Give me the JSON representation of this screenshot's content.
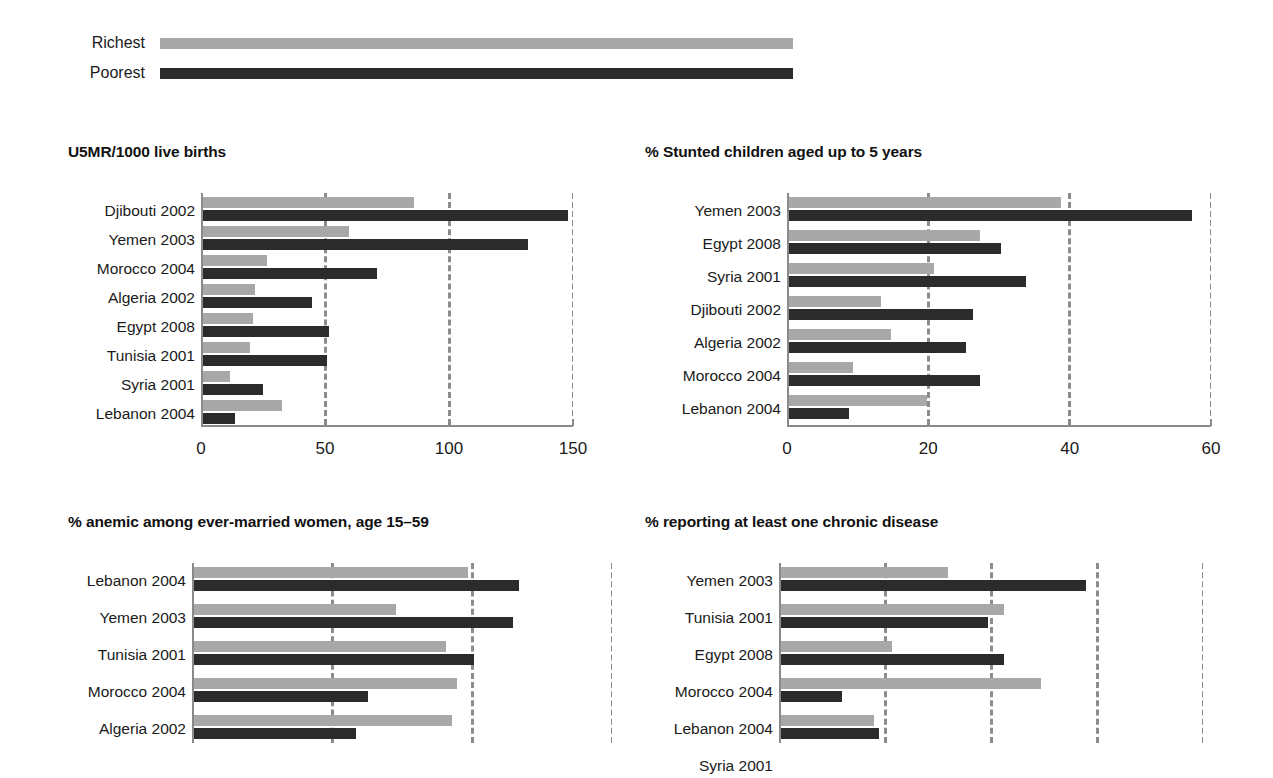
{
  "legend": {
    "items": [
      {
        "label": "Richest",
        "color": "#a8a8a8",
        "bar_width_px": 633
      },
      {
        "label": "Poorest",
        "color": "#2b2b2b",
        "bar_width_px": 633
      }
    ]
  },
  "chart_data": [
    {
      "id": "u5mr",
      "type": "bar",
      "orientation": "horizontal",
      "title": "U5MR/1000 live births",
      "xlabel": "",
      "ylabel": "",
      "xlim": [
        0,
        150
      ],
      "ticks": [
        0,
        50,
        100,
        150
      ],
      "tick_labels": [
        "0",
        "50",
        "100",
        "150"
      ],
      "grid": true,
      "legend_position": "top",
      "categories": [
        "Djibouti 2002",
        "Yemen 2003",
        "Morocco 2004",
        "Algeria 2002",
        "Egypt 2008",
        "Tunisia 2001",
        "Syria 2001",
        "Lebanon 2004"
      ],
      "series": [
        {
          "name": "Richest",
          "color": "#a8a8a8",
          "values": [
            85,
            59,
            26,
            21,
            20,
            19,
            11,
            32
          ]
        },
        {
          "name": "Poorest",
          "color": "#2b2b2b",
          "values": [
            147,
            131,
            70,
            44,
            51,
            50,
            24,
            13
          ]
        }
      ]
    },
    {
      "id": "stunted",
      "type": "bar",
      "orientation": "horizontal",
      "title": "% Stunted children aged up to 5 years",
      "xlabel": "",
      "ylabel": "",
      "xlim": [
        0,
        60
      ],
      "ticks": [
        0,
        20,
        40,
        60
      ],
      "tick_labels": [
        "0",
        "20",
        "40",
        "60"
      ],
      "grid": true,
      "legend_position": "top",
      "categories": [
        "Yemen 2003",
        "Egypt 2008",
        "Syria 2001",
        "Djibouti 2002",
        "Algeria 2002",
        "Morocco 2004",
        "Lebanon 2004"
      ],
      "series": [
        {
          "name": "Richest",
          "color": "#a8a8a8",
          "values": [
            38.5,
            27,
            20.5,
            13,
            14.5,
            9,
            19.5
          ]
        },
        {
          "name": "Poorest",
          "color": "#2b2b2b",
          "values": [
            57,
            30,
            33.5,
            26,
            25,
            27,
            8.5
          ]
        }
      ]
    },
    {
      "id": "anemic",
      "type": "bar",
      "orientation": "horizontal",
      "title": "% anemic among ever-married women, age 15–59",
      "xlabel": "",
      "ylabel": "",
      "xlim": [
        0,
        75
      ],
      "ticks": [
        0,
        25,
        50,
        75
      ],
      "tick_labels": [
        "",
        "",
        "",
        ""
      ],
      "grid": true,
      "legend_position": "top",
      "clipped_bottom": true,
      "categories": [
        "Lebanon 2004",
        "Yemen 2003",
        "Tunisia 2001",
        "Morocco 2004",
        "Algeria 2002"
      ],
      "series": [
        {
          "name": "Richest",
          "color": "#a8a8a8",
          "values": [
            49,
            36,
            45,
            47,
            46
          ]
        },
        {
          "name": "Poorest",
          "color": "#2b2b2b",
          "values": [
            58,
            57,
            50,
            31,
            29
          ]
        }
      ]
    },
    {
      "id": "chronic",
      "type": "bar",
      "orientation": "horizontal",
      "title": "% reporting at least one chronic disease",
      "xlabel": "",
      "ylabel": "",
      "xlim": [
        0,
        80
      ],
      "ticks": [
        0,
        20,
        40,
        60,
        80
      ],
      "tick_labels": [
        "",
        "",
        "",
        "",
        ""
      ],
      "grid": true,
      "legend_position": "top",
      "clipped_bottom": true,
      "categories": [
        "Yemen 2003",
        "Tunisia 2001",
        "Egypt 2008",
        "Morocco 2004",
        "Lebanon 2004",
        "Syria 2001"
      ],
      "series": [
        {
          "name": "Richest",
          "color": "#a8a8a8",
          "values": [
            31.5,
            42,
            21,
            49,
            17.5,
            14
          ]
        },
        {
          "name": "Poorest",
          "color": "#2b2b2b",
          "values": [
            57.5,
            39,
            42,
            11.5,
            18.5,
            11
          ]
        }
      ]
    }
  ]
}
